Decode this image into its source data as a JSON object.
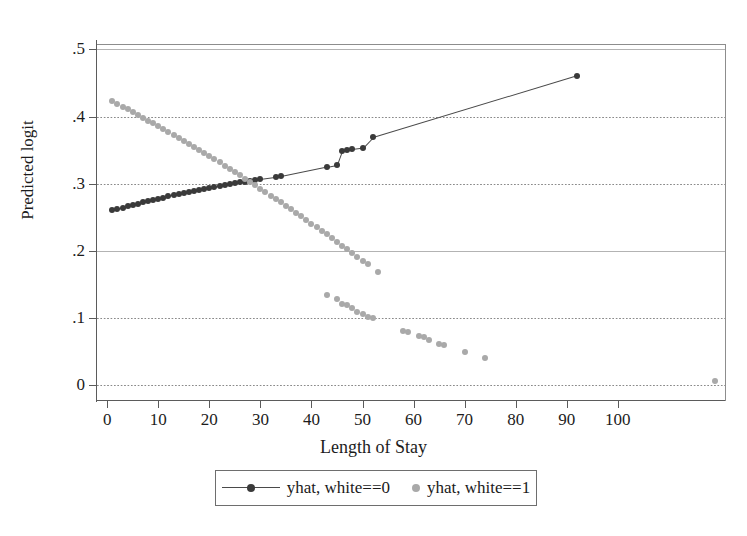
{
  "chart_data": {
    "type": "scatter",
    "title": "",
    "xlabel": "Length of Stay",
    "ylabel": "Predicted logit",
    "xlim": [
      -2,
      121
    ],
    "ylim": [
      -0.022,
      0.508
    ],
    "xticks": [
      0,
      10,
      20,
      30,
      40,
      50,
      60,
      70,
      80,
      90,
      100
    ],
    "xtick_labels": [
      "0",
      "10",
      "20",
      "30",
      "40",
      "50",
      "60",
      "70",
      "80",
      "90",
      "100"
    ],
    "yticks": [
      0,
      0.1,
      0.2,
      0.3,
      0.4,
      0.5
    ],
    "ytick_labels": [
      "0",
      ".1",
      ".2",
      ".3",
      ".4",
      ".5"
    ],
    "grid": "horizontal dotted gridlines at each y tick",
    "legend_position": "below axes, centered, boxed",
    "colors": {
      "series0": "#3a3a3a",
      "series1": "#a9a9a9",
      "axis": "#5b5b5b",
      "grid": "#8a8a8a",
      "frame": "#8d8d8d"
    },
    "series": [
      {
        "name": "yhat, white==0",
        "marker": "filled circle",
        "line": true,
        "color": "#3a3a3a",
        "points": [
          [
            1,
            0.2605
          ],
          [
            2,
            0.2625
          ],
          [
            3,
            0.2645
          ],
          [
            4,
            0.2665
          ],
          [
            5,
            0.2685
          ],
          [
            6,
            0.2705
          ],
          [
            7,
            0.2722
          ],
          [
            8,
            0.274
          ],
          [
            9,
            0.2758
          ],
          [
            10,
            0.2776
          ],
          [
            11,
            0.2793
          ],
          [
            12,
            0.281
          ],
          [
            13,
            0.2828
          ],
          [
            14,
            0.2845
          ],
          [
            15,
            0.2862
          ],
          [
            16,
            0.2878
          ],
          [
            17,
            0.2894
          ],
          [
            18,
            0.291
          ],
          [
            19,
            0.2925
          ],
          [
            20,
            0.294
          ],
          [
            21,
            0.2954
          ],
          [
            22,
            0.2968
          ],
          [
            23,
            0.2982
          ],
          [
            24,
            0.2995
          ],
          [
            25,
            0.3008
          ],
          [
            26,
            0.302
          ],
          [
            27,
            0.3032
          ],
          [
            28,
            0.3044
          ],
          [
            29,
            0.3056
          ],
          [
            30,
            0.3068
          ],
          [
            33,
            0.3098
          ],
          [
            34,
            0.311
          ],
          [
            43,
            0.325
          ],
          [
            45,
            0.328
          ],
          [
            46,
            0.349
          ],
          [
            47,
            0.35
          ],
          [
            48,
            0.351
          ],
          [
            50,
            0.353
          ],
          [
            52,
            0.369
          ],
          [
            92,
            0.461
          ]
        ]
      },
      {
        "name": "yhat, white==1",
        "marker": "open circle",
        "line": false,
        "color": "#a9a9a9",
        "points": [
          [
            1,
            0.4225
          ],
          [
            2,
            0.4185
          ],
          [
            3,
            0.4145
          ],
          [
            4,
            0.4105
          ],
          [
            5,
            0.4065
          ],
          [
            6,
            0.4022
          ],
          [
            7,
            0.3982
          ],
          [
            8,
            0.394
          ],
          [
            9,
            0.3898
          ],
          [
            10,
            0.3856
          ],
          [
            11,
            0.3812
          ],
          [
            12,
            0.377
          ],
          [
            13,
            0.3726
          ],
          [
            14,
            0.3682
          ],
          [
            15,
            0.3638
          ],
          [
            16,
            0.3592
          ],
          [
            17,
            0.3548
          ],
          [
            18,
            0.3502
          ],
          [
            19,
            0.3456
          ],
          [
            20,
            0.341
          ],
          [
            21,
            0.3362
          ],
          [
            22,
            0.3316
          ],
          [
            23,
            0.3268
          ],
          [
            24,
            0.322
          ],
          [
            25,
            0.3172
          ],
          [
            26,
            0.3124
          ],
          [
            27,
            0.3074
          ],
          [
            28,
            0.3026
          ],
          [
            29,
            0.2976
          ],
          [
            30,
            0.2926
          ],
          [
            31,
            0.2876
          ],
          [
            32,
            0.2824
          ],
          [
            33,
            0.2774
          ],
          [
            34,
            0.2722
          ],
          [
            35,
            0.267
          ],
          [
            36,
            0.2618
          ],
          [
            37,
            0.2566
          ],
          [
            38,
            0.2512
          ],
          [
            39,
            0.246
          ],
          [
            40,
            0.2406
          ],
          [
            41,
            0.2352
          ],
          [
            42,
            0.2298
          ],
          [
            43,
            0.2244
          ],
          [
            44,
            0.219
          ],
          [
            45,
            0.2134
          ],
          [
            46,
            0.208
          ],
          [
            47,
            0.2024
          ],
          [
            48,
            0.1968
          ],
          [
            49,
            0.1912
          ],
          [
            50,
            0.1856
          ],
          [
            51,
            0.18
          ],
          [
            53,
            0.169
          ],
          [
            43,
            0.134
          ],
          [
            45,
            0.129
          ],
          [
            46,
            0.1215
          ],
          [
            47,
            0.12
          ],
          [
            48,
            0.115
          ],
          [
            49,
            0.109
          ],
          [
            50,
            0.106
          ],
          [
            51,
            0.1015
          ],
          [
            52,
            0.1005
          ],
          [
            58,
            0.08
          ],
          [
            59,
            0.079
          ],
          [
            61,
            0.0735
          ],
          [
            62,
            0.0725
          ],
          [
            63,
            0.068
          ],
          [
            65,
            0.062
          ],
          [
            66,
            0.06
          ],
          [
            70,
            0.049
          ],
          [
            74,
            0.0405
          ],
          [
            119,
            0.006
          ]
        ]
      }
    ]
  },
  "legend": {
    "entries": [
      {
        "label": "yhat, white==0",
        "key": "line-with-marker"
      },
      {
        "label": "yhat, white==1",
        "key": "marker-only"
      }
    ]
  }
}
